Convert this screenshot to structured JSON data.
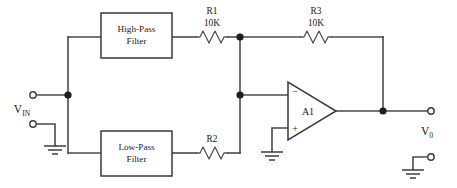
{
  "diagram": {
    "type": "schematic",
    "colors": {
      "background": "#ffffff",
      "wire": "#4a4a4a",
      "node": "#1d1d1d",
      "outline": "#3a3a3a",
      "text": "#1a1a1a"
    },
    "blocks": [
      {
        "id": "high-pass",
        "line1": "High-Pass",
        "line2": "Filter"
      },
      {
        "id": "low-pass",
        "line1": "Low-Pass",
        "line2": "Filter"
      }
    ],
    "resistors": [
      {
        "id": "r1",
        "designator": "R1",
        "value": "10K"
      },
      {
        "id": "r2",
        "designator": "R2",
        "value": ""
      },
      {
        "id": "r3",
        "designator": "R3",
        "value": "10K"
      }
    ],
    "opamp": {
      "designator": "A1",
      "inverting_sign": "−",
      "noninverting_sign": "+"
    },
    "ports": [
      {
        "id": "vin",
        "symbol": "V",
        "subscript": "IN"
      },
      {
        "id": "vout",
        "symbol": "V",
        "subscript": "0"
      }
    ],
    "grounds": [
      {
        "id": "gnd-input"
      },
      {
        "id": "gnd-opamp"
      },
      {
        "id": "gnd-output"
      }
    ]
  }
}
